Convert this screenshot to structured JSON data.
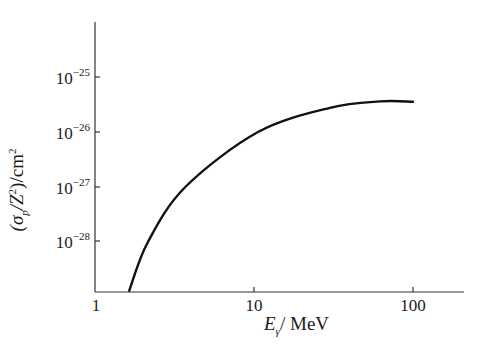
{
  "chart_data": {
    "type": "line",
    "title": "",
    "xlabel": "E_γ / MeV",
    "ylabel": "(σ_p / Z²) / cm²",
    "xscale": "log",
    "yscale": "log",
    "xlim": [
      1,
      200
    ],
    "ylim": [
      7e-30,
      4e-25
    ],
    "x_ticks": [
      1,
      10,
      100
    ],
    "x_tick_labels": [
      "1",
      "10",
      "100"
    ],
    "y_ticks": [
      1e-28,
      1e-27,
      1e-26,
      1e-25
    ],
    "y_tick_labels": [
      "10^-28",
      "10^-27",
      "10^-26",
      "10^-25"
    ],
    "grid": false,
    "legend": null,
    "series": [
      {
        "name": "sigma_p/Z^2",
        "x": [
          1.64,
          2.15,
          3.7,
          10.6,
          30,
          62,
          100
        ],
        "y": [
          1.3e-29,
          1e-28,
          1e-27,
          1e-26,
          2.75e-26,
          3.6e-26,
          3.55e-26
        ]
      }
    ]
  },
  "labels": {
    "x_axis": {
      "main": "E",
      "sub": "γ",
      "unit": "/  MeV"
    },
    "y_axis": {
      "open": "(σ",
      "sub": "p",
      "mid": "/Z",
      "sup": "2",
      "close": ")/cm",
      "sup2": "2"
    },
    "x_ticks": [
      "1",
      "10",
      "100"
    ],
    "y_ticks": [
      {
        "base": "10",
        "exp": "−25"
      },
      {
        "base": "10",
        "exp": "−26"
      },
      {
        "base": "10",
        "exp": "−27"
      },
      {
        "base": "10",
        "exp": "−28"
      }
    ]
  },
  "colors": {
    "line": "#111111",
    "axis": "#333333"
  }
}
